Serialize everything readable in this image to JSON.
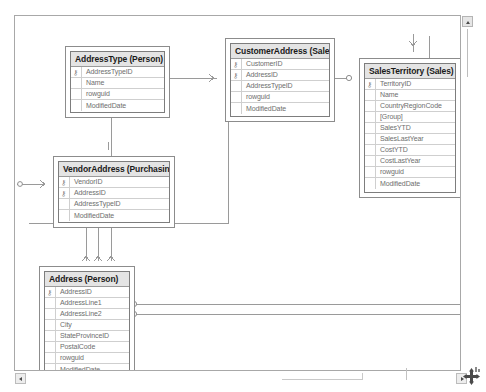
{
  "app": {
    "view_name": "database-diagram",
    "canvas_background": "#ffffff",
    "border_color": "#a8a8a8",
    "table_header_color": "#e4e4e4",
    "connector_color": "#9a9a9a"
  },
  "scrollbars": {
    "vertical": {
      "up_arrow_label": "▲",
      "name": "vertical-scrollbar"
    },
    "horizontal": {
      "left_arrow_label": "◄",
      "right_arrow_label": "►",
      "name": "horizontal-scrollbar"
    }
  },
  "resize_grip": {
    "label": "move-resize-handle"
  },
  "tables": [
    {
      "id": "address-type",
      "title": "AddressType (Person)",
      "x": 50,
      "y": 30,
      "width": 105,
      "height": 72,
      "columns": [
        {
          "name": "AddressTypeID",
          "key": true
        },
        {
          "name": "Name",
          "key": false
        },
        {
          "name": "rowguid",
          "key": false
        },
        {
          "name": "ModifiedDate",
          "key": false
        }
      ]
    },
    {
      "id": "customer-address",
      "title": "CustomerAddress (Sales)",
      "x": 210,
      "y": 22,
      "width": 110,
      "height": 84,
      "columns": [
        {
          "name": "CustomerID",
          "key": true
        },
        {
          "name": "AddressID",
          "key": true
        },
        {
          "name": "AddressTypeID",
          "key": false
        },
        {
          "name": "rowguid",
          "key": false
        },
        {
          "name": "ModifiedDate",
          "key": false
        }
      ]
    },
    {
      "id": "sales-territory",
      "title": "SalesTerritory (Sales)",
      "x": 344,
      "y": 42,
      "width": 102,
      "height": 140,
      "columns": [
        {
          "name": "TerritoryID",
          "key": true
        },
        {
          "name": "Name",
          "key": false
        },
        {
          "name": "CountryRegionCode",
          "key": false
        },
        {
          "name": "[Group]",
          "key": false
        },
        {
          "name": "SalesYTD",
          "key": false
        },
        {
          "name": "SalesLastYear",
          "key": false
        },
        {
          "name": "CostYTD",
          "key": false
        },
        {
          "name": "CostLastYear",
          "key": false
        },
        {
          "name": "rowguid",
          "key": false
        },
        {
          "name": "ModifiedDate",
          "key": false
        }
      ]
    },
    {
      "id": "vendor-address",
      "title": "VendorAddress (Purchasing)",
      "x": 38,
      "y": 140,
      "width": 122,
      "height": 72,
      "columns": [
        {
          "name": "VendorID",
          "key": true
        },
        {
          "name": "AddressID",
          "key": true
        },
        {
          "name": "AddressTypeID",
          "key": false
        },
        {
          "name": "ModifiedDate",
          "key": false
        }
      ]
    },
    {
      "id": "address",
      "title": "Address (Person)",
      "x": 24,
      "y": 250,
      "width": 96,
      "height": 110,
      "columns": [
        {
          "name": "AddressID",
          "key": true
        },
        {
          "name": "AddressLine1",
          "key": false
        },
        {
          "name": "AddressLine2",
          "key": false
        },
        {
          "name": "City",
          "key": false
        },
        {
          "name": "StateProvinceID",
          "key": false
        },
        {
          "name": "PostalCode",
          "key": false
        },
        {
          "name": "rowguid",
          "key": false
        },
        {
          "name": "ModifiedDate",
          "key": false
        }
      ]
    }
  ],
  "key_glyph": "⚷"
}
